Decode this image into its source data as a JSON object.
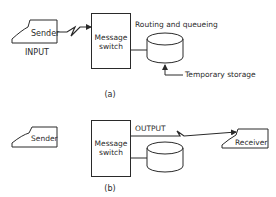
{
  "colors": {
    "stroke": "#2a2a2a",
    "background": "#ffffff"
  },
  "diagram_a": {
    "caption": "(a)",
    "sender_label": "Sender",
    "input_label": "INPUT",
    "switch_label_line1": "Message",
    "switch_label_line2": "switch",
    "routing_label": "Routing and queueing",
    "storage_label": "Temporary storage"
  },
  "diagram_b": {
    "caption": "(b)",
    "sender_label": "Sender",
    "switch_label_line1": "Message",
    "switch_label_line2": "switch",
    "output_label": "OUTPUT",
    "receiver_label": "Receiver"
  }
}
